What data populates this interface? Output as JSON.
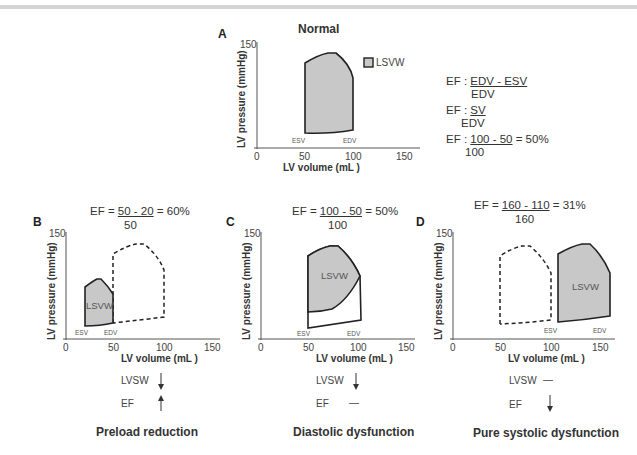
{
  "header": {
    "bar_color": "#d4d4d4"
  },
  "panel_a": {
    "letter": "A",
    "title": "Normal",
    "legend_label": "LSVW",
    "y_label": "LV pressure (mmHg)",
    "x_label": "LV volume (mL )",
    "y_tick_top": "150",
    "x_ticks": [
      "0",
      "50",
      "100",
      "150"
    ],
    "esv_label": "ESV",
    "edv_label": "EDV",
    "formulas": {
      "f1_prefix": "EF :",
      "f1_num": "EDV - ESV",
      "f1_den": "EDV",
      "f2_prefix": "EF :",
      "f2_num": "SV",
      "f2_den": "EDV",
      "f3_prefix": "EF :",
      "f3_num": "100 - 50",
      "f3_suffix": "= 50%",
      "f3_den": "100"
    }
  },
  "panel_b": {
    "letter": "B",
    "ef_prefix": "EF =",
    "ef_num": "50 - 20",
    "ef_suffix": "= 60%",
    "ef_den": "50",
    "y_label": "LV pressure (mmHg)",
    "x_label": "LV volume (mL )",
    "y_tick_top": "150",
    "x_ticks": [
      "0",
      "50",
      "100",
      "150"
    ],
    "loop_label": "LSVW",
    "esv_label": "ESV",
    "edv_label": "EDV",
    "lvsw_label": "LVSW",
    "lvsw_change": "down",
    "ef_label": "EF",
    "ef_change": "up",
    "bottom_title": "Preload reduction"
  },
  "panel_c": {
    "letter": "C",
    "ef_prefix": "EF =",
    "ef_num": "100 - 50",
    "ef_suffix": "= 50%",
    "ef_den": "100",
    "y_label": "LV pressure (mmHg)",
    "x_label": "LV volume (mL )",
    "y_tick_top": "150",
    "x_ticks": [
      "0",
      "50",
      "100",
      "150"
    ],
    "loop_label": "LSVW",
    "esv_label": "ESV",
    "edv_label": "EDV",
    "lvsw_label": "LVSW",
    "lvsw_change": "down",
    "ef_label": "EF",
    "ef_change": "unchanged",
    "ef_change_symbol": "—",
    "bottom_title": "Diastolic dysfunction"
  },
  "panel_d": {
    "letter": "D",
    "ef_prefix": "EF =",
    "ef_num": "160 - 110",
    "ef_suffix": "= 31%",
    "ef_den": "160",
    "y_label": "LV pressure (mmHg)",
    "x_label": "LV volume (mL )",
    "y_tick_top": "150",
    "x_ticks": [
      "0",
      "50",
      "100",
      "150"
    ],
    "loop_label": "LSVW",
    "esv_label": "ESV",
    "edv_label": "EDV",
    "lvsw_label": "LVSW",
    "lvsw_change": "unchanged",
    "lvsw_change_symbol": "—",
    "ef_label": "EF",
    "ef_change": "down",
    "bottom_title": "Pure systolic dysfunction"
  },
  "colors": {
    "loop_fill": "#c8c8c8",
    "loop_stroke": "#222222",
    "axis": "#555555"
  }
}
